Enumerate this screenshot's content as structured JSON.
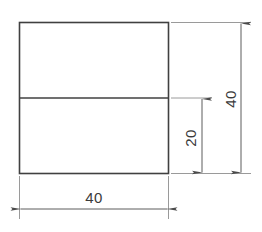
{
  "drawing": {
    "title": "Stepped rectangle section with dimensions",
    "units": "mm",
    "line_color": "#404040",
    "dim_line_color": "#5a5a5a",
    "text_color": "#3a3a3a",
    "background": "#ffffff",
    "shape": {
      "name": "outer-rectangle",
      "width_value": "40",
      "height_value": "40"
    },
    "divider": {
      "name": "horizontal-divider-line",
      "offset_from_bottom": "20"
    },
    "dimensions": [
      {
        "id": "overall-height",
        "label": "40",
        "orientation": "vertical",
        "placement": "right-outer",
        "measures": "overall height of rectangle"
      },
      {
        "id": "lower-section-height",
        "label": "20",
        "orientation": "vertical",
        "placement": "right-inner",
        "measures": "height of lower section below divider"
      },
      {
        "id": "overall-width",
        "label": "40",
        "orientation": "horizontal",
        "placement": "bottom",
        "measures": "overall width of rectangle"
      }
    ]
  }
}
